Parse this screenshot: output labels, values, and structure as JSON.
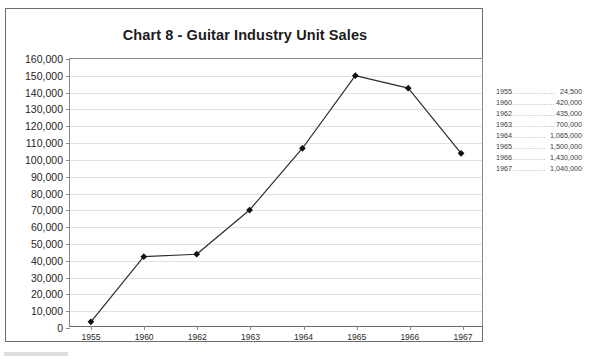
{
  "chart_data": {
    "type": "line",
    "title": "Chart 8 - Guitar Industry Unit Sales",
    "xlabel": "",
    "ylabel": "",
    "categories": [
      "1955",
      "1960",
      "1962",
      "1963",
      "1964",
      "1965",
      "1966",
      "1967"
    ],
    "values": [
      2500,
      41500,
      43000,
      69500,
      106500,
      150000,
      142500,
      103500
    ],
    "ylim": [
      0,
      160000
    ],
    "yticks": [
      "0",
      "10,000",
      "20,000",
      "30,000",
      "40,000",
      "50,000",
      "60,000",
      "70,000",
      "80,000",
      "90,000",
      "100,000",
      "110,000",
      "120,000",
      "130,000",
      "140,000",
      "150,000",
      "160,000"
    ],
    "ytick_values": [
      0,
      10000,
      20000,
      30000,
      40000,
      50000,
      60000,
      70000,
      80000,
      90000,
      100000,
      110000,
      120000,
      130000,
      140000,
      150000,
      160000
    ],
    "grid": true,
    "legend_position": "right-outside",
    "marker": "diamond",
    "line_color": "#2b2b2b",
    "marker_color": "#111111",
    "grid_color": "#e2e2e2",
    "axis_color": "#8a8a8a"
  },
  "legend": {
    "rows": [
      {
        "year": "1955",
        "dots": "..................",
        "value": "24,500"
      },
      {
        "year": "1960",
        "dots": "..................",
        "value": "420,000"
      },
      {
        "year": "1962",
        "dots": "..................",
        "value": "435,000"
      },
      {
        "year": "1963",
        "dots": "..................",
        "value": "700,000"
      },
      {
        "year": "1964",
        "dots": "..............",
        "value": "1,065,000"
      },
      {
        "year": "1965",
        "dots": "..............",
        "value": "1,500,000"
      },
      {
        "year": "1966",
        "dots": "..............",
        "value": "1,430,000"
      },
      {
        "year": "1967",
        "dots": "..............",
        "value": "1,040,000"
      }
    ]
  }
}
